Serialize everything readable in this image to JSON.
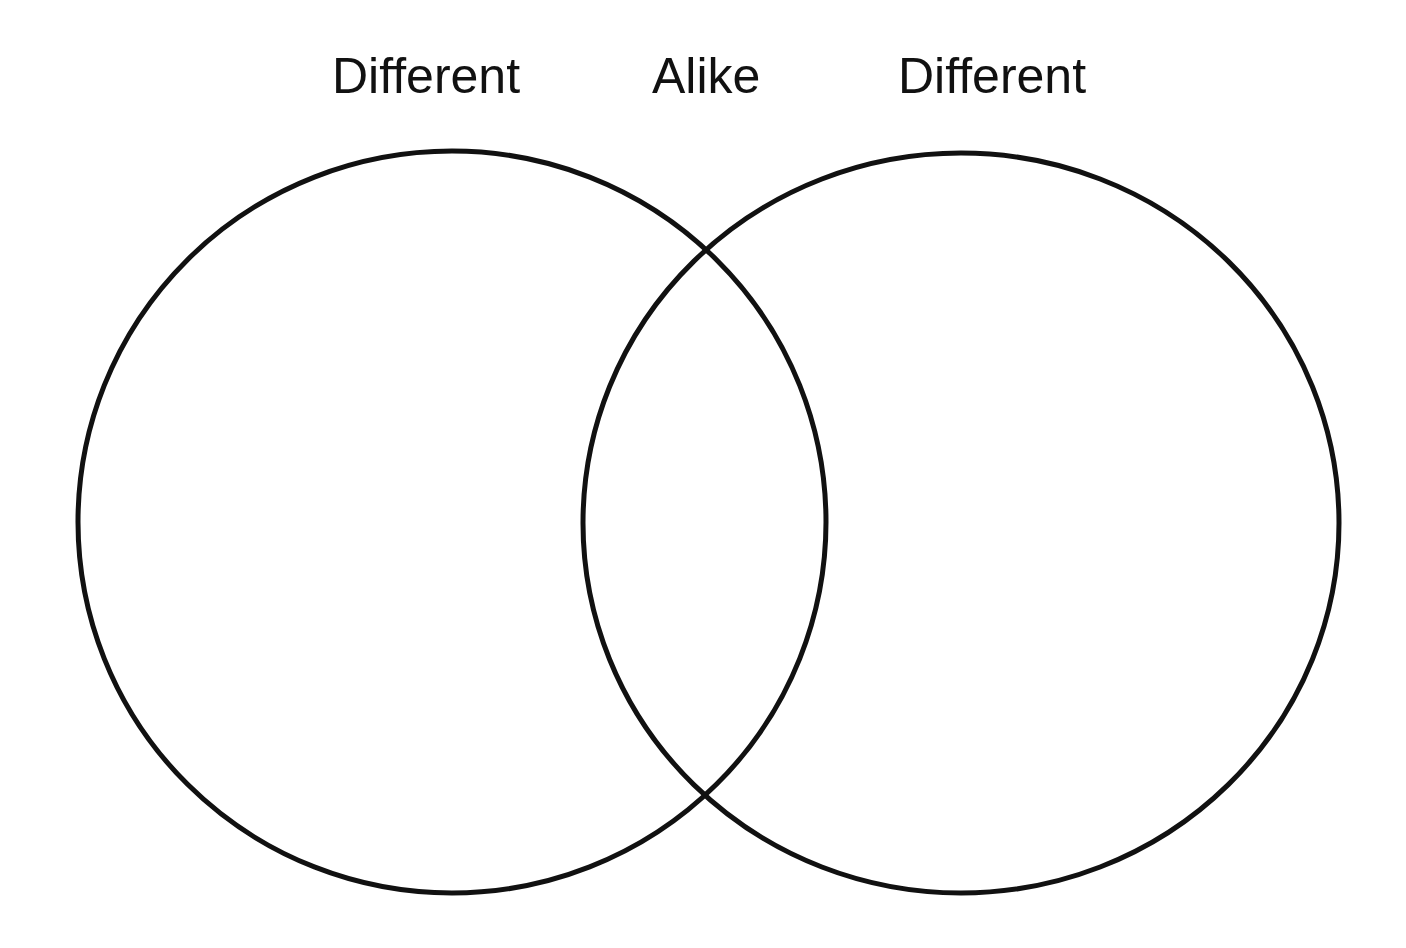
{
  "diagram": {
    "type": "venn",
    "labels": {
      "left": "Different",
      "center": "Alike",
      "right": "Different"
    },
    "circles": [
      {
        "name": "left-circle",
        "cx": 452,
        "cy": 522,
        "rx": 374,
        "ry": 371
      },
      {
        "name": "right-circle",
        "cx": 961,
        "cy": 523,
        "rx": 378,
        "ry": 370
      }
    ],
    "stroke_color": "#111111",
    "background": "#ffffff"
  }
}
